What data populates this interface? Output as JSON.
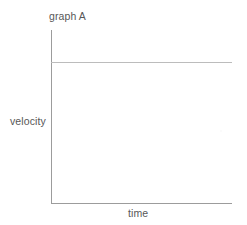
{
  "figure": {
    "title": "graph A",
    "background_color": "#ffffff",
    "axis_color": "#9c9c9c",
    "series_color": "#bcbcbc",
    "text_color": "#575757"
  },
  "labels": {
    "x_axis": "time",
    "y_axis": "velocity"
  },
  "chart_data": {
    "type": "line",
    "title": "graph A",
    "xlabel": "time",
    "ylabel": "velocity",
    "grid": false,
    "legend": null,
    "xticks": [],
    "yticks": [],
    "xlim": [
      0,
      1
    ],
    "ylim": [
      0,
      1
    ],
    "series": [
      {
        "name": "velocity",
        "description": "constant velocity",
        "x": [
          0,
          1
        ],
        "values": [
          0.815,
          0.815
        ]
      }
    ]
  }
}
